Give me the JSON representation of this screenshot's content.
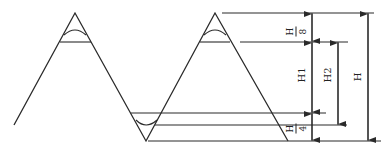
{
  "diagram": {
    "type": "thread-profile-dimension-diagram",
    "labels": {
      "top_fraction": {
        "numerator": "H",
        "denominator": "8"
      },
      "bottom_fraction": {
        "numerator": "H",
        "denominator": "4"
      },
      "h1": "H1",
      "h2": "H2",
      "h": "H"
    },
    "colors": {
      "line": "#2a2a2a",
      "background": "#ffffff"
    }
  }
}
